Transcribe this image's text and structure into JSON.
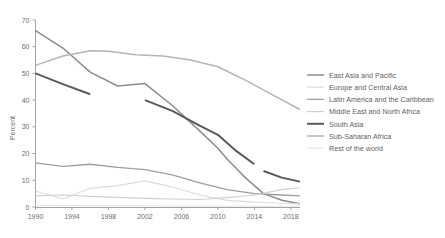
{
  "chart_data": {
    "type": "line",
    "title": "",
    "xlabel": "",
    "ylabel": "Percent",
    "xlim": [
      1990,
      2019
    ],
    "ylim": [
      0,
      70
    ],
    "yticks": [
      0,
      10,
      20,
      30,
      40,
      50,
      60,
      70
    ],
    "xticks": [
      1990,
      1994,
      1998,
      2002,
      2006,
      2010,
      2014,
      2018
    ],
    "grid": false,
    "legend_position": "right",
    "series": [
      {
        "name": "East Asia and Pacific",
        "color": "#8c8c8c",
        "width": 1.5,
        "x": [
          1990,
          1993,
          1996,
          1999,
          2002,
          2005,
          2008,
          2010,
          2011,
          2012,
          2013,
          2015,
          2017,
          2019
        ],
        "y": [
          66.0,
          59.5,
          50.5,
          45.3,
          46.2,
          38.0,
          28.5,
          22.0,
          18.0,
          14.5,
          11.0,
          5.0,
          2.5,
          1.2
        ]
      },
      {
        "name": "Europe and Central Asia",
        "color": "#dcdcdc",
        "width": 1.2,
        "x": [
          1990,
          1993,
          1996,
          1999,
          2002,
          2005,
          2008,
          2011,
          2014,
          2017,
          2019
        ],
        "y": [
          6.0,
          3.0,
          7.0,
          8.0,
          9.8,
          7.5,
          4.5,
          2.5,
          1.8,
          1.4,
          1.2
        ]
      },
      {
        "name": "Latin America and the Caribbean",
        "color": "#9e9e9e",
        "width": 1.3,
        "x": [
          1990,
          1993,
          1996,
          1999,
          2002,
          2005,
          2008,
          2011,
          2014,
          2017,
          2019
        ],
        "y": [
          16.5,
          15.2,
          16.0,
          14.8,
          14.0,
          12.0,
          9.0,
          6.5,
          5.0,
          4.5,
          4.2
        ]
      },
      {
        "name": "Middle East and North Africa",
        "color": "#cfcfcf",
        "width": 1.2,
        "x": [
          1990,
          1993,
          1996,
          1999,
          2002,
          2005,
          2008,
          2011,
          2014,
          2017,
          2019
        ],
        "y": [
          4.2,
          4.5,
          4.0,
          3.6,
          3.2,
          3.0,
          2.8,
          3.5,
          4.5,
          6.5,
          7.2
        ]
      },
      {
        "name": "South Asia",
        "color": "#5a5a5a",
        "width": 2.0,
        "segments": [
          {
            "x": [
              1990,
              1993,
              1996
            ],
            "y": [
              50.0,
              46.0,
              42.2
            ]
          },
          {
            "x": [
              2002,
              2005,
              2008,
              2010,
              2012,
              2014
            ],
            "y": [
              40.0,
              36.0,
              30.5,
              27.0,
              21.0,
              16.0
            ]
          },
          {
            "x": [
              2015,
              2017,
              2019
            ],
            "y": [
              13.5,
              11.0,
              9.5
            ]
          }
        ]
      },
      {
        "name": "Sub-Saharan Africa",
        "color": "#b5b5b5",
        "width": 1.5,
        "x": [
          1990,
          1993,
          1996,
          1998,
          2001,
          2004,
          2007,
          2010,
          2013,
          2016,
          2019
        ],
        "y": [
          53.0,
          56.5,
          58.5,
          58.3,
          57.0,
          56.5,
          55.0,
          52.5,
          47.5,
          42.0,
          36.5
        ]
      },
      {
        "name": "Rest of the world",
        "color": "#e6e6e6",
        "width": 1.1,
        "x": [
          1990,
          1995,
          2000,
          2005,
          2010,
          2015,
          2019
        ],
        "y": [
          0.6,
          0.5,
          0.5,
          0.4,
          0.4,
          0.3,
          0.3
        ]
      }
    ]
  },
  "axes": {
    "ylabel": "Percent",
    "ytick_labels": [
      "0",
      "10",
      "20",
      "30",
      "40",
      "50",
      "60",
      "70"
    ],
    "xtick_labels": [
      "1990",
      "1994",
      "1998",
      "2002",
      "2006",
      "2010",
      "2014",
      "2018"
    ]
  },
  "legend": {
    "items": [
      {
        "label": "East Asia and Pacific"
      },
      {
        "label": "Europe and Central Asia"
      },
      {
        "label": "Latin America and the Caribbean"
      },
      {
        "label": "Middle East and North Africa"
      },
      {
        "label": "South Asia"
      },
      {
        "label": "Sub-Saharan Africa"
      },
      {
        "label": "Rest of the world"
      }
    ]
  }
}
